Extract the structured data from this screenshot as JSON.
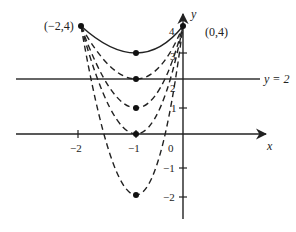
{
  "diagram": {
    "title": "",
    "axes": {
      "x_label": "x",
      "y_label": "y",
      "x_ticks": [
        {
          "value": -2,
          "label": "−2"
        },
        {
          "value": -1,
          "label": "−1"
        },
        {
          "value": 0,
          "label": "0"
        }
      ],
      "y_ticks": [
        {
          "value": 4,
          "label": "4"
        },
        {
          "value": 3,
          "label": "3"
        },
        {
          "value": 2,
          "label": "2"
        },
        {
          "value": 1,
          "label": "1"
        },
        {
          "value": -1,
          "label": "−1"
        },
        {
          "value": -2,
          "label": "−2"
        }
      ]
    },
    "horizontal_line": {
      "equation": "y = 2",
      "label": "y = 2"
    },
    "endpoints": [
      {
        "x": -2,
        "y": 4,
        "label": "(−2,4)"
      },
      {
        "x": 0,
        "y": 4,
        "label": "(0,4)"
      }
    ],
    "curves": [
      {
        "vertex": [
          -1,
          3
        ],
        "style": "solid"
      },
      {
        "vertex": [
          -1,
          2
        ],
        "style": "dashed"
      },
      {
        "vertex": [
          -1,
          1
        ],
        "style": "dashed"
      },
      {
        "vertex": [
          -1,
          0
        ],
        "style": "dashed"
      },
      {
        "vertex": [
          -1,
          -2
        ],
        "style": "dashed"
      }
    ],
    "colors": {
      "ink": "#222222",
      "background": "#ffffff"
    }
  }
}
